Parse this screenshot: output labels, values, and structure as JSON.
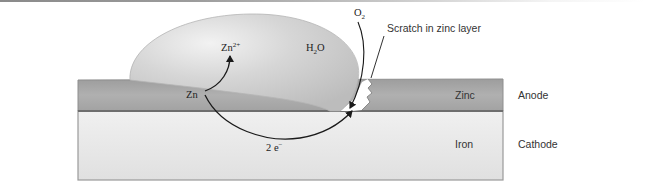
{
  "diagram": {
    "labels": {
      "zn_ion": "Zn",
      "zn_ion_charge": "2+",
      "water": "H",
      "water_sub": "2",
      "water_tail": "O",
      "oxygen": "O",
      "oxygen_sub": "2",
      "zn_metal": "Zn",
      "electrons": "2 e",
      "electrons_sup": "−",
      "scratch": "Scratch in zinc layer",
      "zinc_layer": "Zinc",
      "iron_layer": "Iron",
      "anode": "Anode",
      "cathode": "Cathode"
    },
    "colors": {
      "zinc_layer": "#a9a9a9",
      "iron_layer": "#e6e6e6",
      "droplet": "#d2d2d2",
      "arrow": "#1a1a1a",
      "outline": "#8e8e8e"
    }
  }
}
